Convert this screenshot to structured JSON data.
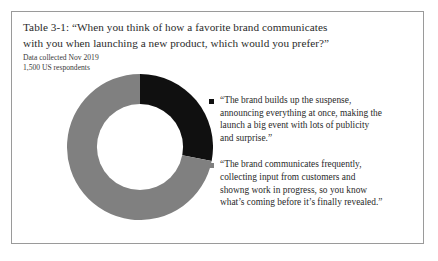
{
  "figure": {
    "caption_lines": [
      "Table 3-1: “When you think of how a favorite brand communicates",
      "with you when launching a new product, which would you prefer?”"
    ],
    "subtitle_lines": [
      "Data collected Nov 2019",
      "1,500 US respondents"
    ],
    "border_color": "#9a9a9a",
    "background_color": "#ffffff"
  },
  "chart_data": {
    "type": "pie",
    "variant": "donut",
    "title": "Table 3-1: “When you think of how a favorite brand communicates with you when launching a new product, which would you prefer?”",
    "subtitle": "Data collected Nov 2019 — 1,500 US respondents",
    "xlabel": "",
    "ylabel": "",
    "grid": false,
    "legend_position": "right",
    "start_angle_deg": 0,
    "direction": "clockwise",
    "inner_radius_ratio": 0.59,
    "categories": [
      "“The brand builds up the suspense, announcing everything at once, making the launch a big event with lots of publicity and surprise.”",
      "“The brand communicates frequently, collecting input from customers and showng work in progress, so you know what’s coming before it’s finally revealed.”"
    ],
    "values": [
      28,
      72
    ],
    "value_unit": "percent",
    "colors": [
      "#101010",
      "#808080"
    ],
    "slices": [
      {
        "label": "suspense-option",
        "value": 28,
        "color": "#101010",
        "start_deg": 0,
        "end_deg": 101
      },
      {
        "label": "frequent-communication-option",
        "value": 72,
        "color": "#808080",
        "start_deg": 101,
        "end_deg": 360
      }
    ]
  },
  "legend": {
    "entries": [
      {
        "swatch_color": "#101010",
        "swatch_name": "legend-swatch-black",
        "lines": [
          "“The brand builds up the suspense,",
          "announcing everything at once, making the",
          "launch a big event with lots of publicity",
          "and surprise.”"
        ]
      },
      {
        "swatch_color": "#808080",
        "swatch_name": "legend-swatch-gray",
        "lines": [
          "“The brand communicates frequently,",
          "collecting input from customers and",
          "showng work in progress, so you know",
          "what’s coming before it’s finally revealed.”"
        ]
      }
    ]
  }
}
